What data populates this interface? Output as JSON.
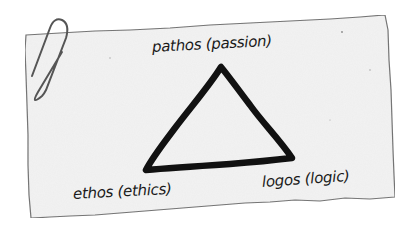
{
  "note_card": {
    "paper_color": "#f2f2f2",
    "edge_color": "#6a6a6a",
    "paperclip_color": "#555555"
  },
  "diagram": {
    "shape": "triangle",
    "stroke_color": "#111111",
    "vertices": {
      "top": "pathos (passion)",
      "bottom_left": "ethos (ethics)",
      "bottom_right": "logos (logic)"
    }
  },
  "labels": {
    "pathos": "pathos (passion)",
    "ethos": "ethos (ethics)",
    "logos": "logos (logic)"
  }
}
